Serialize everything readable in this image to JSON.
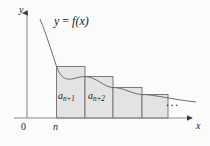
{
  "figure": {
    "kind": "calculus-integral-test-diagram",
    "background_color": "#fbfbfa",
    "axes": {
      "y_axis_label": "y",
      "x_axis_label": "x",
      "origin_label": "0",
      "x_tick_label": "n",
      "axis_color": "#8c8c8c",
      "origin_x": 27,
      "baseline_y": 118
    },
    "curve": {
      "label_prefix": "y",
      "label_equals": "=",
      "label_function": "f(x)",
      "label_full": "y = f(x)",
      "color": "#6e6e6e"
    },
    "bars": {
      "fill_color": "#e3e3e3",
      "stroke_color": "#6e6e6e",
      "items": [
        {
          "label_base": "a",
          "label_sub": "n+1",
          "label_full": "a n+1",
          "x": 56,
          "width": 29,
          "top": 66,
          "height": 52
        },
        {
          "label_base": "a",
          "label_sub": "n+2",
          "label_full": "a n+2",
          "x": 85,
          "width": 28,
          "top": 76,
          "height": 42
        },
        {
          "label_base": "",
          "label_sub": "",
          "label_full": "",
          "x": 113,
          "width": 29,
          "top": 87,
          "height": 31
        },
        {
          "label_base": "",
          "label_sub": "",
          "label_full": "",
          "x": 142,
          "width": 26,
          "top": 94,
          "height": 24
        }
      ]
    },
    "ellipsis": "..."
  }
}
